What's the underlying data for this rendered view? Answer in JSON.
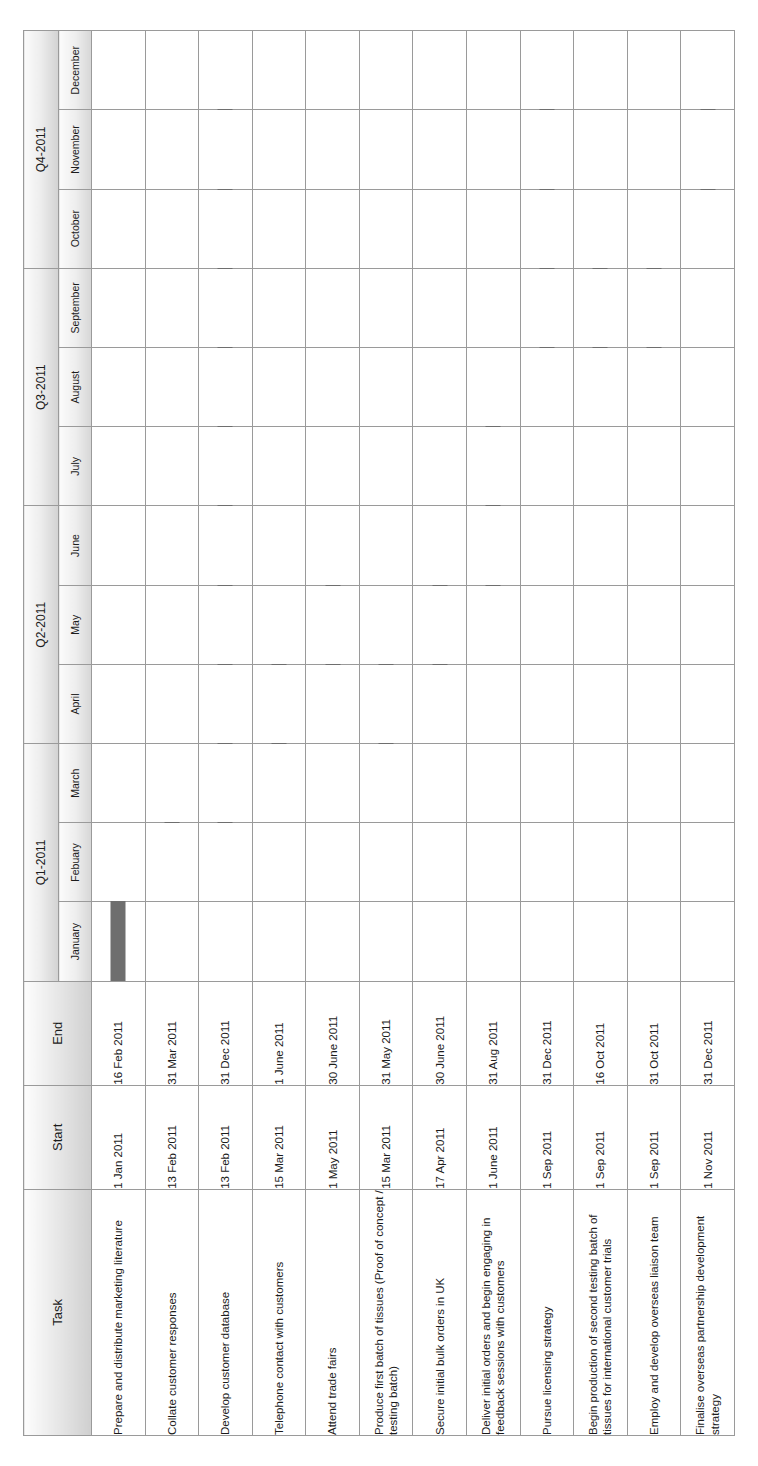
{
  "chart_data": {
    "type": "bar",
    "title": "",
    "xlabel": "",
    "ylabel": "",
    "axis_range": [
      "2011-01-01",
      "2011-12-31"
    ],
    "grid": true,
    "legend": "none",
    "categories": [
      "Prepare and distribute marketing literature",
      "Collate customer responses",
      "Develop customer database",
      "Telephone contact with customers",
      "Attend trade fairs",
      "Produce first batch of tissues (Proof of concept / testing batch)",
      "Secure initial bulk orders in UK",
      "Deliver initial orders and begin engaging in feedback sessions with customers",
      "Pursue licensing strategy",
      "Begin production of second testing batch of tissues for international customer trials",
      "Employ and develop overseas liaison team",
      "Finalise overseas partnership development strategy"
    ],
    "bars": [
      {
        "start_month": 0.0,
        "end_month": 1.52
      },
      {
        "start_month": 1.42,
        "end_month": 3.0
      },
      {
        "start_month": 1.42,
        "end_month": 12.0
      },
      {
        "start_month": 2.46,
        "end_month": 5.0
      },
      {
        "start_month": 4.0,
        "end_month": 6.0
      },
      {
        "start_month": 2.46,
        "end_month": 5.0
      },
      {
        "start_month": 3.53,
        "end_month": 6.0
      },
      {
        "start_month": 5.0,
        "end_month": 8.0
      },
      {
        "start_month": 8.0,
        "end_month": 12.0
      },
      {
        "start_month": 8.0,
        "end_month": 9.5
      },
      {
        "start_month": 8.0,
        "end_month": 10.0
      },
      {
        "start_month": 10.0,
        "end_month": 12.0
      }
    ]
  },
  "table": {
    "headers": {
      "task": "Task",
      "start": "Start",
      "end": "End"
    },
    "quarters": [
      {
        "label": "Q1-2011",
        "span": 3
      },
      {
        "label": "Q2-2011",
        "span": 3
      },
      {
        "label": "Q3-2011",
        "span": 3
      },
      {
        "label": "Q4-2011",
        "span": 3
      }
    ],
    "months": [
      "January",
      "Febuary",
      "March",
      "April",
      "May",
      "June",
      "July",
      "August",
      "September",
      "October",
      "November",
      "December"
    ],
    "rows": [
      {
        "task": "Prepare and distribute marketing literature",
        "start": "1 Jan 2011",
        "end": "16 Feb 2011"
      },
      {
        "task": "Collate customer responses",
        "start": "13 Feb 2011",
        "end": "31 Mar 2011"
      },
      {
        "task": "Develop customer database",
        "start": "13 Feb 2011",
        "end": "31 Dec 2011"
      },
      {
        "task": "Telephone contact with customers",
        "start": "15 Mar 2011",
        "end": "1 June 2011"
      },
      {
        "task": "Attend trade fairs",
        "start": "1 May 2011",
        "end": "30 June 2011"
      },
      {
        "task": "Produce first batch of tissues (Proof of concept / testing batch)",
        "start": "15 Mar 2011",
        "end": "31 May 2011"
      },
      {
        "task": "Secure initial bulk orders in UK",
        "start": "17 Apr 2011",
        "end": "30 June 2011"
      },
      {
        "task": "Deliver initial orders and begin engaging in feedback sessions with customers",
        "start": "1 June 2011",
        "end": "31 Aug 2011"
      },
      {
        "task": "Pursue licensing strategy",
        "start": "1 Sep 2011",
        "end": "31 Dec 2011"
      },
      {
        "task": "Begin production of second testing batch of tissues for international customer trials",
        "start": "1 Sep 2011",
        "end": "16 Oct 2011"
      },
      {
        "task": "Employ and develop overseas liaison team",
        "start": "1 Sep 2011",
        "end": "31 Oct 2011"
      },
      {
        "task": "Finalise overseas partnership development strategy",
        "start": "1 Nov 2011",
        "end": "31 Dec 2011"
      }
    ]
  },
  "colors": {
    "bar": "#6e6e6e",
    "grid": "#9a9a9a",
    "header_border": "#6b6b6b",
    "text": "#1c1c1c"
  }
}
